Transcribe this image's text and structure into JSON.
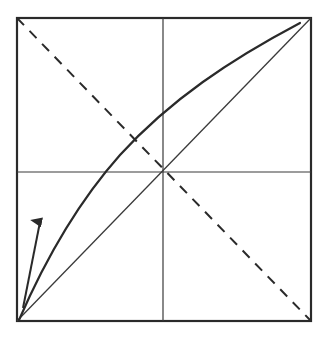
{
  "diagram": {
    "colors": {
      "stroke": "#2a2a2a",
      "background": "#ffffff"
    },
    "frame": {
      "x": 17,
      "y": 18,
      "width": 294,
      "height": 303
    },
    "elements": [
      "frame-box",
      "vertical-midline",
      "horizontal-midline",
      "solid-diagonal",
      "dashed-anti-diagonal",
      "concave-curve",
      "tangent-arrow"
    ]
  }
}
